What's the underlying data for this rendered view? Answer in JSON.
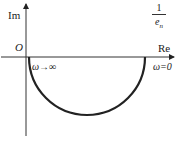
{
  "diagram": {
    "type": "nyquist-plot",
    "axes": {
      "imag_label": "Im",
      "real_label": "Re",
      "origin_label": "O"
    },
    "annotations": {
      "omega_inf": "ω→∞",
      "omega_zero": "ω=0",
      "intercept_numerator": "1",
      "intercept_denominator": "e",
      "intercept_subscript": "n"
    },
    "curve": "lower semicircle from origin (ω→∞) to 1/e_n on real axis (ω=0)",
    "colors": {
      "line": "#222222",
      "background": "#ffffff"
    }
  }
}
